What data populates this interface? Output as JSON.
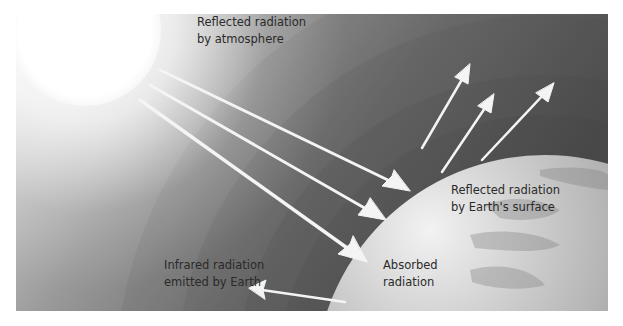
{
  "diagram": {
    "labels": {
      "reflected_atmosphere": {
        "line1": "Reflected radiation",
        "line2": "by atmosphere"
      },
      "reflected_surface": {
        "line1": "Reflected radiation",
        "line2": "by Earth's surface"
      },
      "infrared": {
        "line1": "Infrared radiation",
        "line2": "emitted by Earth"
      },
      "absorbed": {
        "line1": "Absorbed",
        "line2": "radiation"
      }
    },
    "elements": {
      "sun": "sun",
      "earth": "earth",
      "atmosphere": "atmosphere-layers",
      "incoming_arrows": 3,
      "reflected_arrows": 3,
      "infrared_arrows": 1
    },
    "colors": {
      "sun": "#ffffff",
      "background_light": "#e8e8e8",
      "background_dark": "#505050",
      "earth_light": "#e6e6e6",
      "earth_dark": "#8a8a8a",
      "arrow": "#f4f4f4",
      "text": "#2a2a2a"
    }
  }
}
